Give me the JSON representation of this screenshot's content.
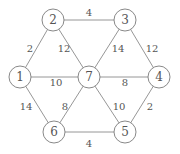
{
  "graph": {
    "node_radius": 11,
    "nodes": [
      {
        "id": "1",
        "label": "1",
        "x": 20,
        "y": 77
      },
      {
        "id": "2",
        "label": "2",
        "x": 53,
        "y": 20
      },
      {
        "id": "3",
        "label": "3",
        "x": 125,
        "y": 20
      },
      {
        "id": "4",
        "label": "4",
        "x": 159,
        "y": 77
      },
      {
        "id": "5",
        "label": "5",
        "x": 125,
        "y": 132
      },
      {
        "id": "6",
        "label": "6",
        "x": 54,
        "y": 132
      },
      {
        "id": "7",
        "label": "7",
        "x": 89,
        "y": 77
      }
    ],
    "edges": [
      {
        "from": "2",
        "to": "3",
        "weight": "4",
        "lx": 89,
        "ly": 12
      },
      {
        "from": "1",
        "to": "2",
        "weight": "2",
        "lx": 30,
        "ly": 48
      },
      {
        "from": "2",
        "to": "7",
        "weight": "12",
        "lx": 64,
        "ly": 48
      },
      {
        "from": "3",
        "to": "7",
        "weight": "14",
        "lx": 118,
        "ly": 48
      },
      {
        "from": "3",
        "to": "4",
        "weight": "12",
        "lx": 152,
        "ly": 48
      },
      {
        "from": "1",
        "to": "7",
        "weight": "10",
        "lx": 56,
        "ly": 82
      },
      {
        "from": "7",
        "to": "4",
        "weight": "8",
        "lx": 125,
        "ly": 82
      },
      {
        "from": "1",
        "to": "6",
        "weight": "14",
        "lx": 26,
        "ly": 106
      },
      {
        "from": "7",
        "to": "6",
        "weight": "8",
        "lx": 65,
        "ly": 106
      },
      {
        "from": "7",
        "to": "5",
        "weight": "10",
        "lx": 119,
        "ly": 106
      },
      {
        "from": "4",
        "to": "5",
        "weight": "2",
        "lx": 150,
        "ly": 106
      },
      {
        "from": "6",
        "to": "5",
        "weight": "4",
        "lx": 89,
        "ly": 143
      }
    ]
  }
}
